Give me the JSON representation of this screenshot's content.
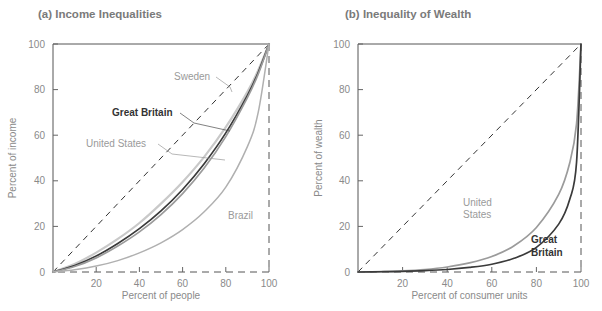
{
  "figure": {
    "width": 602,
    "height": 311,
    "background": "#ffffff"
  },
  "chart_data": [
    {
      "type": "line",
      "panel": "a",
      "title": "(a) Income Inequalities",
      "xlabel": "Percent of people",
      "ylabel": "Percent of income",
      "xlim": [
        0,
        100
      ],
      "ylim": [
        0,
        100
      ],
      "xticks": [
        0,
        20,
        40,
        60,
        80,
        100
      ],
      "yticks": [
        0,
        20,
        40,
        60,
        80,
        100
      ],
      "xticklabels": [
        "0",
        "20",
        "40",
        "60",
        "80",
        "100"
      ],
      "yticklabels": [
        "0",
        "20",
        "40",
        "60",
        "80",
        "100"
      ],
      "grid": false,
      "legend": "inline-annotations",
      "reference_line": {
        "name": "line-of-equality",
        "style": "dashed",
        "from": [
          0,
          0
        ],
        "to": [
          100,
          100
        ],
        "color": "#333333"
      },
      "x": [
        0,
        10,
        20,
        30,
        40,
        50,
        60,
        70,
        80,
        90,
        95,
        100
      ],
      "series": [
        {
          "name": "Sweden",
          "color": "#c9c9c9",
          "width": 2.2,
          "label_bold": false,
          "values": [
            0,
            3.5,
            8.5,
            14.5,
            21.5,
            30.0,
            39.5,
            50.5,
            63.5,
            79.0,
            88.5,
            100
          ]
        },
        {
          "name": "Great Britain",
          "color": "#3a3a3a",
          "width": 1.7,
          "label_bold": true,
          "values": [
            0,
            2.8,
            7.0,
            12.5,
            19.0,
            26.8,
            36.2,
            47.5,
            61.0,
            77.5,
            87.5,
            100
          ]
        },
        {
          "name": "United States",
          "color": "#9b9b9b",
          "width": 1.7,
          "label_bold": false,
          "values": [
            0,
            2.4,
            6.2,
            11.4,
            17.6,
            25.2,
            34.4,
            45.6,
            59.4,
            76.5,
            86.8,
            100
          ]
        },
        {
          "name": "Brazil",
          "color": "#b0b0b0",
          "width": 1.5,
          "label_bold": false,
          "values": [
            0,
            1.0,
            2.6,
            5.0,
            8.4,
            12.8,
            18.6,
            26.4,
            37.2,
            55.0,
            70.0,
            100
          ]
        }
      ],
      "annotations": [
        {
          "text": "Sweden",
          "x_px": 174,
          "y_px": 80,
          "bold": false,
          "leader_to": [
            232,
            92
          ]
        },
        {
          "text": "Great Britain",
          "x_px": 112,
          "y_px": 116,
          "bold": true,
          "leader_to": [
            230,
            131
          ]
        },
        {
          "text": "United States",
          "x_px": 86,
          "y_px": 147,
          "bold": false,
          "leader_to": [
            225,
            160
          ]
        },
        {
          "text": "Brazil",
          "x_px": 228,
          "y_px": 219,
          "bold": false,
          "leader_to": null
        }
      ]
    },
    {
      "type": "line",
      "panel": "b",
      "title": "(b) Inequality of Wealth",
      "xlabel": "Percent of consumer units",
      "ylabel": "Percent of wealth",
      "xlim": [
        0,
        100
      ],
      "ylim": [
        0,
        100
      ],
      "xticks": [
        0,
        20,
        40,
        60,
        80,
        100
      ],
      "yticks": [
        0,
        20,
        40,
        60,
        80,
        100
      ],
      "xticklabels": [
        "0",
        "20",
        "40",
        "60",
        "80",
        "100"
      ],
      "yticklabels": [
        "0",
        "20",
        "40",
        "60",
        "80",
        "100"
      ],
      "grid": false,
      "legend": "inline-annotations",
      "reference_line": {
        "name": "line-of-equality",
        "style": "dashed",
        "from": [
          0,
          0
        ],
        "to": [
          100,
          100
        ],
        "color": "#333333"
      },
      "x": [
        0,
        10,
        20,
        30,
        40,
        50,
        60,
        70,
        80,
        90,
        95,
        98,
        100
      ],
      "series": [
        {
          "name": "United States",
          "color": "#9b9b9b",
          "width": 1.7,
          "label_bold": false,
          "values": [
            0,
            0.2,
            0.5,
            1.1,
            2.2,
            4.0,
            6.8,
            11.5,
            19.5,
            34.0,
            48.0,
            65.0,
            100
          ]
        },
        {
          "name": "Great Britain",
          "color": "#3a3a3a",
          "width": 1.7,
          "label_bold": true,
          "values": [
            0,
            0.1,
            0.3,
            0.6,
            1.1,
            2.0,
            3.4,
            6.0,
            10.8,
            21.0,
            32.0,
            48.0,
            100
          ]
        }
      ],
      "annotations": [
        {
          "text": "United",
          "x_px": 463,
          "y_px": 206,
          "bold": false
        },
        {
          "text": "States",
          "x_px": 463,
          "y_px": 218,
          "bold": false
        },
        {
          "text": "Great",
          "x_px": 531,
          "y_px": 243,
          "bold": true
        },
        {
          "text": "Britain",
          "x_px": 531,
          "y_px": 256,
          "bold": true
        }
      ]
    }
  ],
  "colors": {
    "title": "#7a7a7a",
    "tick_label": "#8a8a8a",
    "axis_title": "#8a8a8a",
    "frame": "#555555",
    "diagonal": "#333333",
    "sweden": "#c9c9c9",
    "great_britain": "#3a3a3a",
    "united_states": "#9b9b9b",
    "brazil": "#b0b0b0"
  }
}
